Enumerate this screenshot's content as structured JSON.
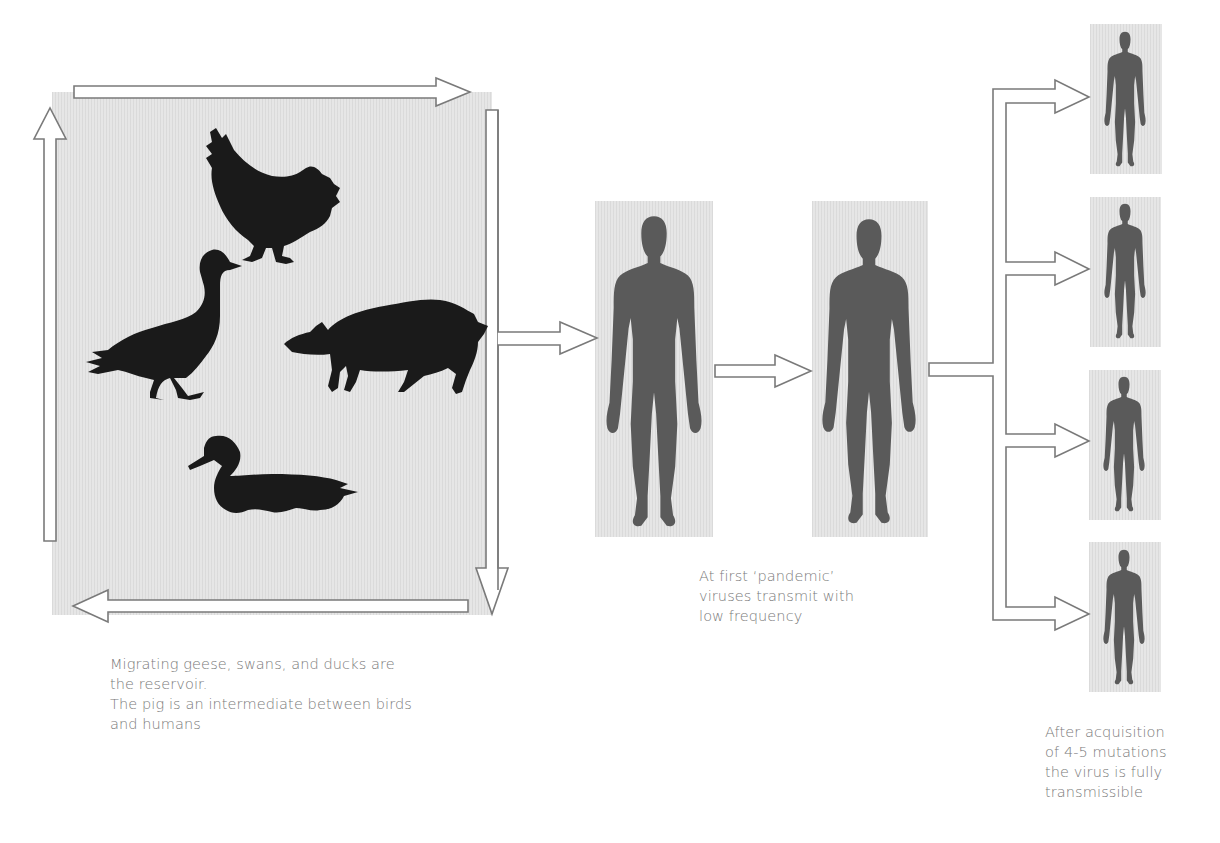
{
  "diagram": {
    "colors": {
      "panel_background": "#e6e6e6",
      "animal_silhouette": "#1a1a1a",
      "human_silhouette": "#5a5a5a",
      "arrow_stroke": "#7a7a7a",
      "caption_text": "#7a7a7a"
    },
    "reservoir": {
      "animals": [
        {
          "name": "chicken",
          "icon": "chicken-icon"
        },
        {
          "name": "goose",
          "icon": "goose-icon"
        },
        {
          "name": "pig",
          "icon": "pig-icon"
        },
        {
          "name": "duck",
          "icon": "duck-icon"
        }
      ],
      "cycle_arrows": [
        "top-right",
        "right-down",
        "bottom-left",
        "left-up"
      ],
      "caption": {
        "line1": "Migrating geese, swans, and ducks are",
        "line2": "the reservoir.",
        "line3": "The pig is an intermediate between birds",
        "line4": "and humans"
      }
    },
    "early_stage": {
      "humans": [
        {
          "name": "human-1",
          "icon": "human-icon"
        },
        {
          "name": "human-2",
          "icon": "human-icon"
        }
      ],
      "caption": {
        "line1": "At first ‘pandemic’",
        "line2": "viruses transmit with",
        "line3": "low frequency"
      }
    },
    "late_stage": {
      "humans": [
        {
          "name": "human-3",
          "icon": "human-icon"
        },
        {
          "name": "human-4",
          "icon": "human-icon"
        },
        {
          "name": "human-5",
          "icon": "human-icon"
        },
        {
          "name": "human-6",
          "icon": "human-icon"
        }
      ],
      "caption": {
        "line1": "After acquisition",
        "line2": "of 4-5 mutations",
        "line3": "the virus is fully",
        "line4": "transmissible"
      }
    }
  }
}
